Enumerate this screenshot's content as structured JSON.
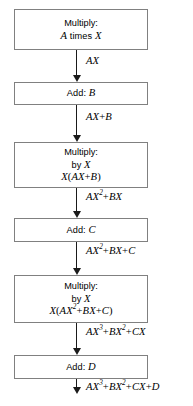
{
  "diagram": {
    "colors": {
      "background": "#ffffff",
      "box_border": "#808080",
      "arrow": "#1a1a1a",
      "text": "#000000"
    },
    "nodes": [
      {
        "id": "multiply-a-times-x",
        "lines": [
          "Multiply:",
          "A times X"
        ],
        "line1": "Multiply:",
        "line2_var1": "A",
        "line2_op": " times ",
        "line2_var2": "X"
      },
      {
        "id": "add-b",
        "label_op": "Add: ",
        "label_var": "B"
      },
      {
        "id": "multiply-by-x-1",
        "line1": "Multiply:",
        "line2_op": "by ",
        "line2_var": "X",
        "line3": "X(AX+B)"
      },
      {
        "id": "add-c",
        "label_op": "Add: ",
        "label_var": "C"
      },
      {
        "id": "multiply-by-x-2",
        "line1": "Multiply:",
        "line2_op": "by ",
        "line2_var": "X",
        "line3": "X(AX2+BX+C)"
      },
      {
        "id": "add-d",
        "label_op": "Add: ",
        "label_var": "D"
      }
    ],
    "edge_labels": [
      {
        "id": "edge-label-ax",
        "text": "AX"
      },
      {
        "id": "edge-label-ax-plus-b",
        "text": "AX+B"
      },
      {
        "id": "edge-label-ax2-plus-bx",
        "text": "AX2+BX"
      },
      {
        "id": "edge-label-ax2-plus-bx-plus-c",
        "text": "AX2+BX+C"
      },
      {
        "id": "edge-label-ax3-plus-bx2-plus-cx",
        "text": "AX3+BX2+CX"
      },
      {
        "id": "edge-label-result",
        "text": "AX3+BX2+CX+D"
      }
    ]
  }
}
